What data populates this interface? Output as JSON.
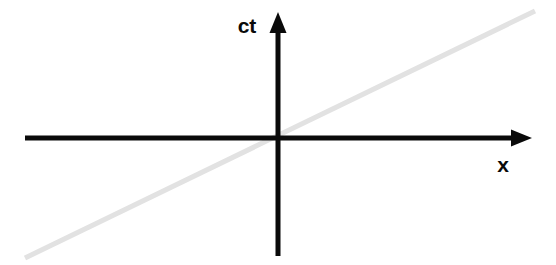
{
  "figure": {
    "kind": "spacetime-diagram",
    "title": "",
    "width": 556,
    "height": 265,
    "background_color": "#ffffff"
  },
  "labels": {
    "time_axis": "ct",
    "space_axis": "x"
  },
  "chart_data": {
    "type": "line",
    "title": "",
    "subtitle": "",
    "xlabel": "x",
    "ylabel": "ct",
    "grid": false,
    "legend": null,
    "axis_style": "arrowed-cross-through-origin",
    "origin_px": [
      278,
      138
    ],
    "axes": [
      {
        "name": "space-axis",
        "label": "x",
        "orientation": "horizontal",
        "color": "#0a0a0a",
        "thickness_px": 5,
        "start_px": [
          25,
          138
        ],
        "end_px": [
          532,
          138
        ],
        "arrowhead": "end",
        "label_px": [
          503,
          164
        ]
      },
      {
        "name": "time-axis",
        "label": "ct",
        "orientation": "vertical",
        "color": "#0a0a0a",
        "thickness_px": 5,
        "start_px": [
          278,
          256
        ],
        "end_px": [
          278,
          12
        ],
        "arrowhead": "end",
        "label_px": [
          247,
          25
        ]
      }
    ],
    "series": [
      {
        "name": "worldline",
        "kind": "straight-line",
        "color": "#e2e2e2",
        "thickness_px": 5,
        "passes_through_origin": true,
        "start_px": [
          25,
          258
        ],
        "end_px": [
          535,
          11
        ],
        "slope_px_per_px": -0.4843,
        "x": [
          25,
          278,
          535
        ],
        "y": [
          258,
          138,
          11
        ],
        "comment": ""
      }
    ],
    "xlim": [
      25,
      532
    ],
    "ylim": [
      256,
      12
    ]
  },
  "colors": {
    "axis": "#0a0a0a",
    "worldline": "#e2e2e2",
    "background": "#ffffff",
    "text": "#0a0a0a"
  }
}
